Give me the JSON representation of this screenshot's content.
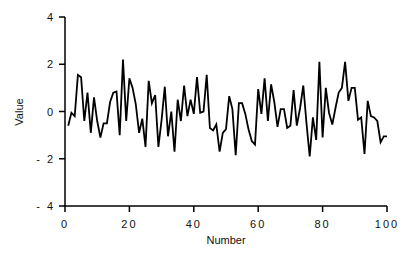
{
  "chart_data": {
    "type": "line",
    "title": "",
    "xlabel": "Number",
    "ylabel": "Value",
    "xlim": [
      0,
      100
    ],
    "ylim": [
      -4,
      4
    ],
    "x_ticks": [
      0,
      20,
      40,
      60,
      80,
      100
    ],
    "x_tick_labels": [
      "0",
      "20",
      "40",
      "60",
      "80",
      "100"
    ],
    "y_ticks": [
      4,
      2,
      0,
      -2,
      -4
    ],
    "y_tick_labels": [
      "4",
      "2",
      "0",
      "- 2",
      "- 4"
    ],
    "grid": false,
    "legend": null,
    "series": [
      {
        "name": "Value",
        "color": "#000000",
        "x": [
          1,
          2,
          3,
          4,
          5,
          6,
          7,
          8,
          9,
          10,
          11,
          12,
          13,
          14,
          15,
          16,
          17,
          18,
          19,
          20,
          21,
          22,
          23,
          24,
          25,
          26,
          27,
          28,
          29,
          30,
          31,
          32,
          33,
          34,
          35,
          36,
          37,
          38,
          39,
          40,
          41,
          42,
          43,
          44,
          45,
          46,
          47,
          48,
          49,
          50,
          51,
          52,
          53,
          54,
          55,
          56,
          57,
          58,
          59,
          60,
          61,
          62,
          63,
          64,
          65,
          66,
          67,
          68,
          69,
          70,
          71,
          72,
          73,
          74,
          75,
          76,
          77,
          78,
          79,
          80,
          81,
          82,
          83,
          84,
          85,
          86,
          87,
          88,
          89,
          90,
          91,
          92,
          93,
          94,
          95,
          96,
          97,
          98,
          99,
          100
        ],
        "values": [
          -0.6,
          -0.05,
          -0.2,
          1.55,
          1.45,
          -0.4,
          0.8,
          -0.9,
          0.6,
          -0.4,
          -1.1,
          -0.5,
          -0.5,
          0.4,
          0.8,
          0.85,
          -1.0,
          2.2,
          -0.4,
          1.4,
          1.0,
          0.3,
          -0.9,
          -0.3,
          -1.5,
          1.3,
          0.35,
          0.7,
          -1.5,
          -0.35,
          1.05,
          -1.05,
          0.0,
          -1.7,
          0.5,
          -0.4,
          1.1,
          -0.2,
          0.5,
          -0.1,
          1.45,
          -0.05,
          0.0,
          1.55,
          -0.7,
          -0.8,
          -0.55,
          -1.7,
          -0.9,
          -0.75,
          0.65,
          0.1,
          -1.85,
          0.35,
          0.35,
          -0.1,
          -0.75,
          -1.25,
          -1.4,
          0.95,
          -0.1,
          1.4,
          -0.4,
          1.15,
          0.4,
          -0.65,
          0.1,
          0.1,
          -0.7,
          -0.6,
          0.9,
          -0.6,
          0.15,
          1.1,
          -0.5,
          -1.9,
          -0.25,
          -1.2,
          2.1,
          -1.1,
          1.0,
          -0.05,
          -0.55,
          0.15,
          0.8,
          1.0,
          2.1,
          0.45,
          1.0,
          1.0,
          -0.35,
          -0.25,
          -1.8,
          0.45,
          -0.2,
          -0.25,
          -0.4,
          -1.3,
          -1.05,
          -1.05
        ]
      }
    ]
  }
}
